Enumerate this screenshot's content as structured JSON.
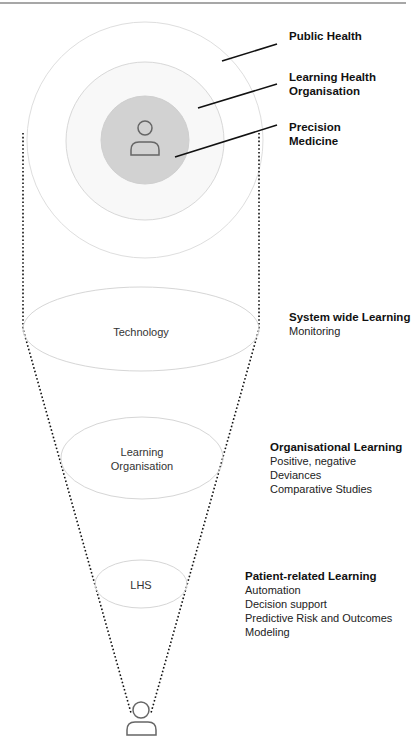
{
  "rings": {
    "outer": {
      "label": "Public Health"
    },
    "middle": {
      "label_line1": "Learning Health",
      "label_line2": "Organisation"
    },
    "inner": {
      "label_line1": "Precision",
      "label_line2": "Medicine"
    }
  },
  "ellipses": {
    "technology": {
      "text": "Technology"
    },
    "learning_org": {
      "line1": "Learning",
      "line2": "Organisation"
    },
    "lhs": {
      "text": "LHS"
    }
  },
  "levels": [
    {
      "title": "System wide Learning",
      "items": [
        "Monitoring"
      ]
    },
    {
      "title": "Organisational Learning",
      "items": [
        "Positive, negative",
        "Deviances",
        "Comparative Studies"
      ]
    },
    {
      "title": "Patient-related Learning",
      "items": [
        "Automation",
        "Decision support",
        "Predictive Risk and Outcomes",
        "Modeling"
      ]
    }
  ],
  "icons": {
    "center": "person-icon",
    "bottom": "person-icon"
  },
  "colors": {
    "inner_fill": "#d4d4d4",
    "ring_fill": "#f8f8f8",
    "ring_stroke": "#dcdcdc",
    "dots": "#111111",
    "top_rule": "#888888"
  }
}
